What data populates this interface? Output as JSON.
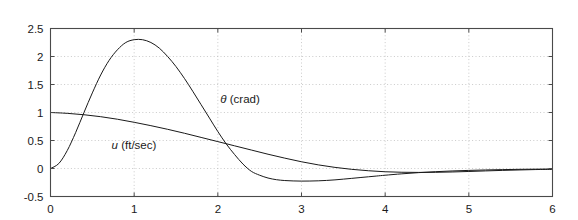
{
  "chart_data": {
    "type": "line",
    "title": "",
    "xlabel": "",
    "ylabel": "",
    "xlim": [
      0,
      6
    ],
    "ylim": [
      -0.5,
      2.5
    ],
    "grid": true,
    "grid_style": "dotted",
    "legend_position": "inline-annotations",
    "xticks": [
      "0",
      "1",
      "2",
      "3",
      "4",
      "5",
      "6"
    ],
    "xtick_values": [
      0,
      1,
      2,
      3,
      4,
      5,
      6
    ],
    "yticks": [
      "-0.5",
      "0",
      "0.5",
      "1",
      "1.5",
      "2",
      "2.5"
    ],
    "ytick_values": [
      -0.5,
      0,
      0.5,
      1,
      1.5,
      2,
      2.5
    ],
    "series": [
      {
        "name": "theta (crad)",
        "color": "#1a1a1a",
        "x": [
          0,
          0.1,
          0.2,
          0.3,
          0.4,
          0.5,
          0.6,
          0.7,
          0.8,
          0.9,
          1.0,
          1.1,
          1.2,
          1.3,
          1.4,
          1.5,
          1.6,
          1.7,
          1.8,
          1.9,
          2.0,
          2.1,
          2.2,
          2.3,
          2.4,
          2.5,
          2.6,
          2.7,
          2.8,
          2.9,
          3.0,
          3.1,
          3.2,
          3.3,
          3.4,
          3.5,
          3.6,
          3.7,
          3.8,
          3.9,
          4.0,
          4.2,
          4.4,
          4.6,
          4.8,
          5.0,
          5.2,
          5.4,
          5.6,
          5.8,
          6.0
        ],
        "y": [
          0.0,
          0.09,
          0.32,
          0.64,
          1.0,
          1.35,
          1.67,
          1.93,
          2.12,
          2.25,
          2.3,
          2.3,
          2.25,
          2.15,
          2.0,
          1.82,
          1.61,
          1.38,
          1.14,
          0.9,
          0.66,
          0.44,
          0.25,
          0.08,
          -0.05,
          -0.12,
          -0.17,
          -0.2,
          -0.215,
          -0.222,
          -0.225,
          -0.224,
          -0.22,
          -0.213,
          -0.203,
          -0.19,
          -0.176,
          -0.162,
          -0.148,
          -0.134,
          -0.12,
          -0.095,
          -0.074,
          -0.057,
          -0.044,
          -0.034,
          -0.026,
          -0.02,
          -0.015,
          -0.012,
          -0.01
        ]
      },
      {
        "name": "u (ft/sec)",
        "color": "#1a1a1a",
        "x": [
          0,
          0.2,
          0.4,
          0.6,
          0.8,
          1.0,
          1.2,
          1.4,
          1.6,
          1.8,
          2.0,
          2.2,
          2.4,
          2.6,
          2.8,
          3.0,
          3.2,
          3.4,
          3.6,
          3.8,
          4.0,
          4.2,
          4.4,
          4.6,
          4.8,
          5.0,
          5.2,
          5.4,
          5.6,
          5.8,
          6.0
        ],
        "y": [
          1.0,
          0.985,
          0.96,
          0.925,
          0.88,
          0.825,
          0.765,
          0.7,
          0.63,
          0.555,
          0.48,
          0.405,
          0.33,
          0.255,
          0.185,
          0.12,
          0.065,
          0.02,
          -0.015,
          -0.04,
          -0.058,
          -0.067,
          -0.07,
          -0.068,
          -0.062,
          -0.053,
          -0.043,
          -0.034,
          -0.026,
          -0.019,
          -0.014
        ]
      }
    ],
    "annotations": [
      {
        "id": "theta-label",
        "symbol": "θ",
        "text": " (crad)",
        "x": 2.03,
        "y": 1.17
      },
      {
        "id": "u-label",
        "symbol": "u",
        "text": " (ft/sec)",
        "x": 0.73,
        "y": 0.35
      }
    ]
  }
}
